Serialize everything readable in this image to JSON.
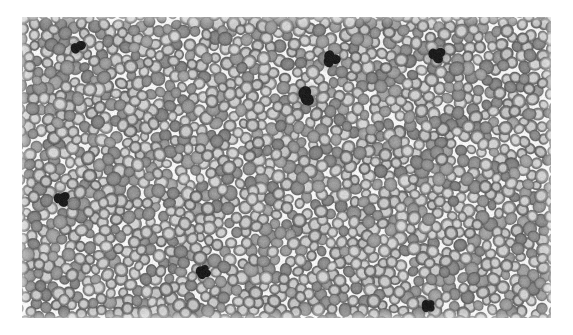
{
  "document": {
    "kind": "micrograph",
    "subject": "peripheral-blood-smear",
    "alt_text": "Light micrograph of a peripheral blood smear showing a dense monolayer of red blood cells with central pallor and several darkly stained leukocyte nuclei",
    "canvas": {
      "width": 573,
      "height": 335
    },
    "background_color": "#ffffff"
  },
  "image_region": {
    "x": 22,
    "y": 17,
    "width": 529,
    "height": 301,
    "field_background_color": "#efeeea",
    "tone": "grayscale"
  },
  "palette": {
    "field": "#efeeea",
    "rbc_body": "#8d8d8a",
    "rbc_rim": "#6f6f6d",
    "rbc_pallor": "#c8c7c2",
    "leukocyte": "#23221f",
    "page_white": "#ffffff"
  },
  "render_params": {
    "rbc_count": 2150,
    "rbc_radius_min": 5.0,
    "rbc_radius_max": 7.2,
    "rbc_pallor_ratio": 0.47,
    "packing_min_center_distance": 8.2,
    "noise_strength": 26,
    "blur_radius_px": 0.7,
    "random_seed": 20240517
  },
  "leukocytes": [
    {
      "label": "leukocyte-upper-right-a",
      "x": 331,
      "y": 59,
      "rx": 9.0,
      "ry": 8.2,
      "lobes": 3
    },
    {
      "label": "leukocyte-upper-mid",
      "x": 306,
      "y": 96,
      "rx": 9.6,
      "ry": 7.8,
      "lobes": 2
    },
    {
      "label": "leukocyte-upper-right-b",
      "x": 437,
      "y": 55,
      "rx": 8.6,
      "ry": 8.0,
      "lobes": 3
    },
    {
      "label": "leukocyte-left-mid",
      "x": 62,
      "y": 199,
      "rx": 8.4,
      "ry": 7.6,
      "lobes": 3
    },
    {
      "label": "leukocyte-lower-mid",
      "x": 203,
      "y": 272,
      "rx": 7.4,
      "ry": 6.8,
      "lobes": 4
    },
    {
      "label": "leukocyte-lower-right",
      "x": 428,
      "y": 306,
      "rx": 7.2,
      "ry": 6.4,
      "lobes": 4
    },
    {
      "label": "leukocyte-upper-left",
      "x": 78,
      "y": 47,
      "rx": 6.6,
      "ry": 6.0,
      "lobes": 2
    }
  ],
  "sparse_lanes": [
    {
      "label": "pale-streak-upper-left",
      "x": 120,
      "y": 70,
      "rx": 52,
      "ry": 20,
      "angle": -22
    },
    {
      "label": "pale-streak-mid-left",
      "x": 105,
      "y": 150,
      "rx": 44,
      "ry": 16,
      "angle": 12
    },
    {
      "label": "pale-streak-center",
      "x": 300,
      "y": 165,
      "rx": 58,
      "ry": 18,
      "angle": -8
    },
    {
      "label": "pale-streak-lower-right",
      "x": 420,
      "y": 245,
      "rx": 46,
      "ry": 17,
      "angle": 18
    },
    {
      "label": "pale-streak-upper-right",
      "x": 470,
      "y": 110,
      "rx": 40,
      "ry": 15,
      "angle": -30
    }
  ]
}
